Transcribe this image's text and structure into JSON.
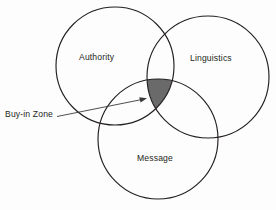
{
  "figure": {
    "type": "venn-diagram",
    "set_count": 3,
    "background_color": "#fdfdfd",
    "outline_color": "#231f20",
    "highlight_color": "#6a6a6a"
  },
  "circles": [
    {
      "key": "authority",
      "label": "Authority",
      "cx": 115,
      "cy": 66,
      "r": 59
    },
    {
      "key": "linguistics",
      "label": "Linguistics",
      "cx": 208,
      "cy": 77,
      "r": 61
    },
    {
      "key": "message",
      "label": "Message",
      "cx": 158,
      "cy": 139,
      "r": 60
    }
  ],
  "labels": {
    "authority": "Authority",
    "linguistics": "Linguistics",
    "message": "Message"
  },
  "callout": {
    "label": "Buy-in Zone",
    "describes": "triple-intersection of Authority, Linguistics and Message",
    "line_start_x": 57,
    "line_start_y": 116,
    "line_end_x": 146,
    "line_end_y": 98
  },
  "shaded_region": {
    "name": "buy-in-zone",
    "color": "#6a6a6a",
    "members": [
      "Authority",
      "Linguistics",
      "Message"
    ]
  }
}
